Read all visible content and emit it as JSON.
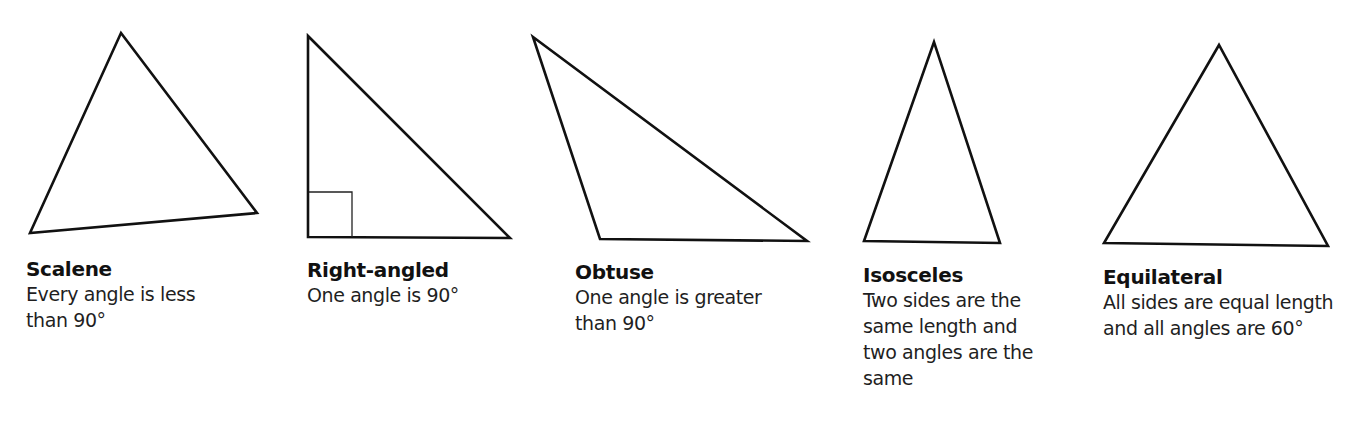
{
  "figure": {
    "topic": "Types of triangles",
    "stroke_color": "#111111",
    "background_color": "#ffffff"
  },
  "triangles": [
    {
      "id": "scalene",
      "title": "Scalene",
      "description": "Every angle is less than 90°"
    },
    {
      "id": "right",
      "title": "Right-angled",
      "description": "One angle is 90°",
      "right_angle_marker": true
    },
    {
      "id": "obtuse",
      "title": "Obtuse",
      "description": "One angle is greater than 90°"
    },
    {
      "id": "isosceles",
      "title": "Isosceles",
      "description": "Two sides are the same length and two angles are the same"
    },
    {
      "id": "equilateral",
      "title": "Equilateral",
      "description": "All sides are equal length and all angles are 60°"
    }
  ]
}
